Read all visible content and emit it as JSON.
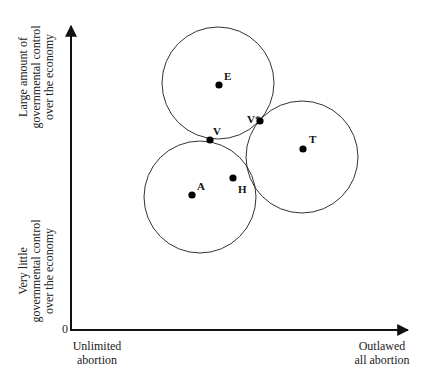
{
  "diagram": {
    "axes": {
      "origin_label": "0",
      "y_axis_top_label": [
        "Large amount of",
        "governmental control",
        "over the economy"
      ],
      "y_axis_bottom_label": [
        "Very little",
        "governmental control",
        "over the economy"
      ],
      "x_axis_left_label": [
        "Unlimited",
        "abortion"
      ],
      "x_axis_right_label": [
        "Outlawed",
        "all abortion"
      ]
    },
    "points": [
      {
        "id": "E",
        "label": "E",
        "x": 219,
        "y": 85
      },
      {
        "id": "V",
        "label": "V",
        "x": 210,
        "y": 140
      },
      {
        "id": "V*",
        "label": "V*",
        "x": 260,
        "y": 121
      },
      {
        "id": "T",
        "label": "T",
        "x": 303,
        "y": 149
      },
      {
        "id": "A",
        "label": "A",
        "x": 192,
        "y": 195
      },
      {
        "id": "H",
        "label": "H",
        "x": 233,
        "y": 178
      }
    ],
    "circles": [
      {
        "center": "E",
        "cx": 218,
        "cy": 83,
        "r": 56
      },
      {
        "center": "A-H",
        "cx": 200,
        "cy": 197,
        "r": 56
      },
      {
        "center": "T",
        "cx": 302,
        "cy": 157,
        "r": 56
      }
    ]
  }
}
